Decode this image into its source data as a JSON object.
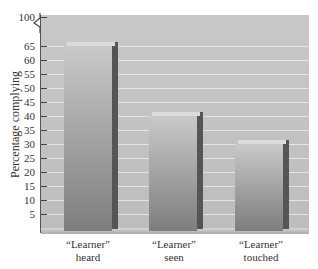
{
  "chart_data": {
    "type": "bar",
    "title": "",
    "xlabel": "",
    "ylabel": "Percentage complying",
    "categories": [
      "“Learner” heard",
      "“Learner” seen",
      "“Learner” touched"
    ],
    "category_lines": [
      [
        "“Learner”",
        "heard"
      ],
      [
        "“Learner”",
        "seen"
      ],
      [
        "“Learner”",
        "touched"
      ]
    ],
    "values": [
      65,
      40,
      30
    ],
    "y_ticks": [
      5,
      10,
      15,
      20,
      25,
      30,
      35,
      40,
      45,
      50,
      55,
      60,
      65,
      100
    ],
    "ylim": [
      0,
      100
    ],
    "axis_break": "between 65 and 100",
    "grid": true,
    "legend": null,
    "style": "3D bars, grey gradient"
  },
  "colors": {
    "background": "#ffffff",
    "plot_area": "#c4c4c4",
    "bar_face": "#a3a3a3",
    "bar_side": "#555555",
    "gridline": "#e8e8e8"
  }
}
